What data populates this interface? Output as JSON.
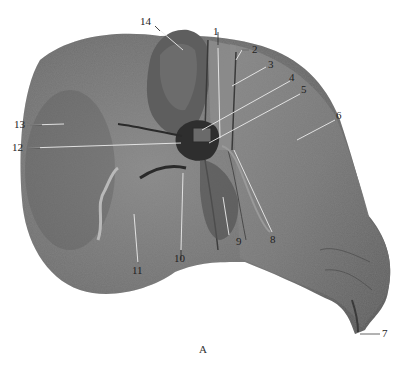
{
  "figure": {
    "caption": "A",
    "labels": [
      {
        "id": "1",
        "text": "1",
        "x": 215,
        "y": 36,
        "line": [
          [
            218,
            48
          ],
          [
            220,
            138
          ]
        ]
      },
      {
        "id": "2",
        "text": "2",
        "x": 252,
        "y": 45,
        "line": [
          [
            249,
            50
          ],
          [
            242,
            50
          ],
          [
            236,
            60
          ]
        ]
      },
      {
        "id": "3",
        "text": "3",
        "x": 268,
        "y": 62,
        "line": [
          [
            266,
            67
          ],
          [
            232,
            86
          ]
        ]
      },
      {
        "id": "4",
        "text": "4",
        "x": 290,
        "y": 78,
        "line": [
          [
            290,
            81
          ],
          [
            202,
            130
          ]
        ]
      },
      {
        "id": "5",
        "text": "5",
        "x": 301,
        "y": 90,
        "line": [
          [
            300,
            94
          ],
          [
            209,
            143
          ]
        ]
      },
      {
        "id": "6",
        "text": "6",
        "x": 337,
        "y": 116,
        "line": [
          [
            335,
            120
          ],
          [
            297,
            140
          ]
        ]
      },
      {
        "id": "7",
        "text": "7",
        "x": 382,
        "y": 330,
        "line": [
          [
            380,
            334
          ],
          [
            360,
            334
          ]
        ]
      },
      {
        "id": "8",
        "text": "8",
        "x": 272,
        "y": 237,
        "line": [
          [
            272,
            232
          ],
          [
            234,
            150
          ]
        ]
      },
      {
        "id": "9",
        "text": "9",
        "x": 229,
        "y": 239,
        "line": [
          [
            229,
            235
          ],
          [
            223,
            197
          ]
        ]
      },
      {
        "id": "10",
        "text": "10",
        "x": 174,
        "y": 255,
        "line": [
          [
            181,
            250
          ],
          [
            183,
            173
          ]
        ]
      },
      {
        "id": "11",
        "text": "11",
        "x": 132,
        "y": 269,
        "line": [
          [
            138,
            264
          ],
          [
            134,
            214
          ]
        ]
      },
      {
        "id": "12",
        "text": "12",
        "x": 10,
        "y": 145,
        "line": [
          [
            28,
            148
          ],
          [
            181,
            143
          ]
        ]
      },
      {
        "id": "13",
        "text": "13",
        "x": 14,
        "y": 123,
        "line": [
          [
            30,
            125
          ],
          [
            64,
            124
          ]
        ]
      },
      {
        "id": "14",
        "text": "14",
        "x": 144,
        "y": 18,
        "line": [
          [
            155,
            26
          ],
          [
            183,
            50
          ]
        ]
      }
    ],
    "colors": {
      "background": "#ffffff",
      "tissue_mid": "#7a7a7a",
      "tissue_dark": "#4a4a4a",
      "tissue_light": "#9a9a9a",
      "leader_line": "#e8e8e8",
      "label_text": "#222222"
    }
  }
}
